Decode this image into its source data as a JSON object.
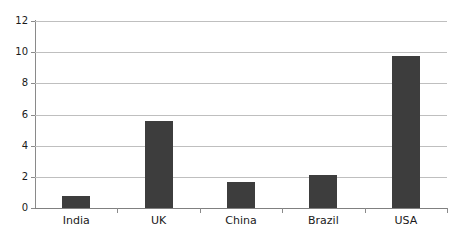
{
  "chart_data": {
    "type": "bar",
    "title": "",
    "subtitle": "",
    "xlabel": "",
    "ylabel": "",
    "categories": [
      "India",
      "UK",
      "China",
      "Brazil",
      "USA"
    ],
    "values": [
      0.75,
      5.6,
      1.7,
      2.15,
      9.75
    ],
    "series": [
      {
        "name": "",
        "values": [
          0.75,
          5.6,
          1.7,
          2.15,
          9.75
        ]
      }
    ],
    "ylim": [
      0,
      12
    ],
    "yticks": [
      0,
      2,
      4,
      6,
      8,
      10,
      12
    ],
    "ytick_labels": [
      "0",
      "2",
      "4",
      "6",
      "8",
      "10",
      "12"
    ],
    "xtick_labels": [
      "India",
      "UK",
      "China",
      "Brazil",
      "USA"
    ],
    "grid": true,
    "grid_axis": "y",
    "legend": false,
    "legend_position": "none",
    "annotations": [],
    "colors": {
      "bar": "#3d3d3d",
      "gridline": "#bfbfbf",
      "axis": "#8a8a8a",
      "baseline": "#808080",
      "text": "#1a1a1a",
      "background": "#ffffff"
    }
  }
}
